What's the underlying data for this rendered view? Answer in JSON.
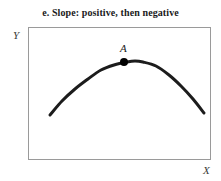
{
  "figure": {
    "title": "e. Slope: positive, then negative",
    "axes": {
      "y_label": "Y",
      "x_label": "X"
    },
    "annotations": [
      {
        "label": "A"
      }
    ]
  },
  "chart_data": {
    "type": "line",
    "title": "e. Slope: positive, then negative",
    "xlabel": "X",
    "ylabel": "Y",
    "grid": false,
    "legend": null,
    "axis_ticks": {
      "x": [],
      "y": []
    },
    "series": [
      {
        "name": "curve",
        "color": "#1c1c1c",
        "linewidth": 3,
        "x": [
          50,
          62,
          75,
          88,
          101,
          114,
          127,
          135,
          143,
          156,
          169,
          181,
          193,
          204
        ],
        "y": [
          115,
          101,
          89,
          79,
          70,
          65,
          62,
          61,
          62,
          66,
          75,
          86,
          99,
          113
        ]
      }
    ],
    "points": [
      {
        "label": "A",
        "x": 124,
        "y": 62,
        "marker": "filled-circle",
        "color": "#000000",
        "size": 6
      }
    ],
    "xlim": [
      28,
      211
    ],
    "ylim": [
      160,
      27
    ]
  }
}
